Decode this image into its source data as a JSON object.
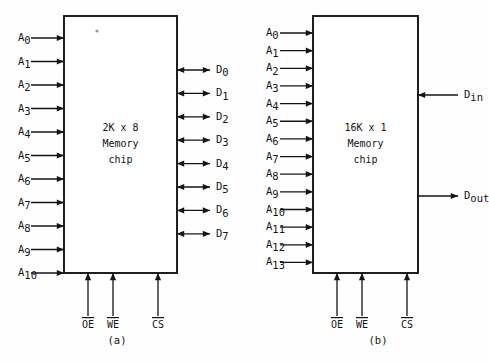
{
  "figure": {
    "background_color": "#fefefe",
    "line_color": "#141414"
  },
  "diagrams": [
    {
      "id": "a",
      "caption": "(a)",
      "chip_label_lines": [
        "2K x 8",
        "Memory",
        "chip"
      ],
      "organization": "2K x 8",
      "address_pins": [
        {
          "label": "A",
          "sub": "0"
        },
        {
          "label": "A",
          "sub": "1"
        },
        {
          "label": "A",
          "sub": "2"
        },
        {
          "label": "A",
          "sub": "3"
        },
        {
          "label": "A",
          "sub": "4"
        },
        {
          "label": "A",
          "sub": "5"
        },
        {
          "label": "A",
          "sub": "6"
        },
        {
          "label": "A",
          "sub": "7"
        },
        {
          "label": "A",
          "sub": "8"
        },
        {
          "label": "A",
          "sub": "9"
        },
        {
          "label": "A",
          "sub": "10"
        }
      ],
      "address_direction": "in",
      "data_pins": [
        {
          "label": "D",
          "sub": "0",
          "direction": "bidirectional"
        },
        {
          "label": "D",
          "sub": "1",
          "direction": "bidirectional"
        },
        {
          "label": "D",
          "sub": "2",
          "direction": "bidirectional"
        },
        {
          "label": "D",
          "sub": "3",
          "direction": "bidirectional"
        },
        {
          "label": "D",
          "sub": "4",
          "direction": "bidirectional"
        },
        {
          "label": "D",
          "sub": "5",
          "direction": "bidirectional"
        },
        {
          "label": "D",
          "sub": "6",
          "direction": "bidirectional"
        },
        {
          "label": "D",
          "sub": "7",
          "direction": "bidirectional"
        }
      ],
      "control_pins": [
        {
          "label": "OE",
          "active_low": true,
          "direction": "in"
        },
        {
          "label": "WE",
          "active_low": true,
          "direction": "in"
        },
        {
          "label": "CS",
          "active_low": true,
          "direction": "in"
        }
      ]
    },
    {
      "id": "b",
      "caption": "(b)",
      "chip_label_lines": [
        "16K x 1",
        "Memory",
        "chip"
      ],
      "organization": "16K x 1",
      "address_pins": [
        {
          "label": "A",
          "sub": "0"
        },
        {
          "label": "A",
          "sub": "1"
        },
        {
          "label": "A",
          "sub": "2"
        },
        {
          "label": "A",
          "sub": "3"
        },
        {
          "label": "A",
          "sub": "4"
        },
        {
          "label": "A",
          "sub": "5"
        },
        {
          "label": "A",
          "sub": "6"
        },
        {
          "label": "A",
          "sub": "7"
        },
        {
          "label": "A",
          "sub": "8"
        },
        {
          "label": "A",
          "sub": "9"
        },
        {
          "label": "A",
          "sub": "10"
        },
        {
          "label": "A",
          "sub": "11"
        },
        {
          "label": "A",
          "sub": "12"
        },
        {
          "label": "A",
          "sub": "13"
        }
      ],
      "address_direction": "in",
      "data_pins": [
        {
          "label": "D",
          "sub": "in",
          "direction": "in"
        },
        {
          "label": "D",
          "sub": "out",
          "direction": "out"
        }
      ],
      "control_pins": [
        {
          "label": "OE",
          "active_low": true,
          "direction": "in"
        },
        {
          "label": "WE",
          "active_low": true,
          "direction": "in"
        },
        {
          "label": "CS",
          "active_low": true,
          "direction": "in"
        }
      ]
    }
  ]
}
